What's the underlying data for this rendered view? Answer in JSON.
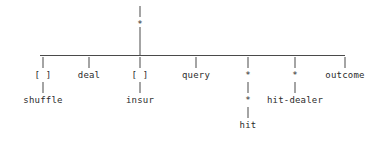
{
  "diagram": {
    "background_color": "#ffffff",
    "line_color": "#4a4a4a",
    "text_color": "#2b2b2b",
    "root": {
      "label": "*",
      "x": 140,
      "label_y": 19,
      "stub_top_y": 6,
      "stub_bottom_y": 17,
      "drop_top_y": 27,
      "drop_bottom_y": 55
    },
    "bar": {
      "y": 55,
      "x_start": 40,
      "x_end": 345
    },
    "tick": {
      "top_y": 57,
      "bottom_y": 68
    },
    "rows": {
      "level1_label_y": 70,
      "level1_link_top_y": 82,
      "level1_link_bottom_y": 93,
      "level2_label_y": 95,
      "level2_link_top_y": 107,
      "level2_link_bottom_y": 118,
      "level3_label_y": 120
    },
    "children": [
      {
        "label": "[ ]",
        "x": 43,
        "child": {
          "label": "shuffle",
          "x": 43
        }
      },
      {
        "label": "deal",
        "x": 89,
        "child": null
      },
      {
        "label": "[ ]",
        "x": 140,
        "child": {
          "label": "insur",
          "x": 140
        }
      },
      {
        "label": "query",
        "x": 196,
        "child": null
      },
      {
        "label": "*",
        "x": 248,
        "child": {
          "label": "*",
          "x": 248,
          "child": {
            "label": "hit",
            "x": 248
          }
        }
      },
      {
        "label": "*",
        "x": 295,
        "child": {
          "label": "hit-dealer",
          "x": 295
        }
      },
      {
        "label": "outcome",
        "x": 345,
        "child": null
      }
    ]
  }
}
